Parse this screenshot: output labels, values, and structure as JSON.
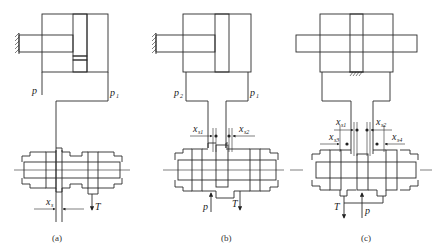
{
  "figure": {
    "panels": [
      {
        "id": "a",
        "caption": "(a)",
        "labels": {
          "p_left": "p",
          "p_right": "p",
          "p_right_sub": "1",
          "x": "x",
          "x_sub": "s",
          "T": "T"
        }
      },
      {
        "id": "b",
        "caption": "(b)",
        "labels": {
          "p_left": "p",
          "p_left_sub": "2",
          "p_right": "p",
          "p_right_sub": "1",
          "x1": "x",
          "x1_sub": "s1",
          "x2": "x",
          "x2_sub": "s2",
          "p": "p",
          "T": "T"
        }
      },
      {
        "id": "c",
        "caption": "(c)",
        "labels": {
          "x1": "x",
          "x1_sub": "s1",
          "x2": "x",
          "x2_sub": "s2",
          "x3": "x",
          "x3_sub": "s3",
          "x4": "x",
          "x4_sub": "s4",
          "T": "T",
          "p": "p"
        }
      }
    ]
  }
}
